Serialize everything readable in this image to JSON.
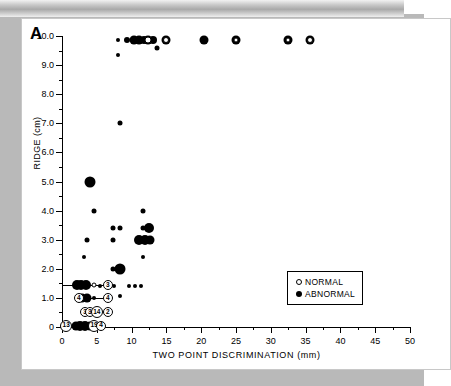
{
  "figure": {
    "panel_label": "A"
  },
  "chart_data": {
    "type": "scatter",
    "title": "",
    "xlabel": "TWO POINT DISCRIMINATION  (mm)",
    "ylabel": "RIDGE (cm)",
    "xlim": [
      0,
      50
    ],
    "ylim": [
      0,
      10
    ],
    "xticks": [
      0,
      5,
      10,
      15,
      20,
      25,
      30,
      35,
      40,
      45,
      50
    ],
    "xticklabels": [
      "0",
      "5",
      "10",
      "15",
      "20",
      "25",
      "30",
      "35",
      "40",
      "45",
      "50"
    ],
    "x_minor_step": 2.5,
    "yticks": [
      0,
      1,
      2,
      3,
      4,
      5,
      6,
      7,
      8,
      9,
      10
    ],
    "yticklabels": [
      "0",
      "1.0",
      "2.0",
      "3.0",
      "4.0",
      "5.0",
      "6.0",
      "7.0",
      "8.0",
      "9.0",
      "10.0"
    ],
    "y_minor_step": 0.5,
    "grid": false,
    "legend_position": "lower right",
    "legend": [
      {
        "label": "NORMAL",
        "marker": "open-circle"
      },
      {
        "label": "ABNORMAL",
        "marker": "filled-circle"
      }
    ],
    "series": [
      {
        "name": "ABNORMAL",
        "marker": "filled-circle",
        "points": [
          {
            "x": 8.0,
            "y": 9.85,
            "size": 4
          },
          {
            "x": 8.0,
            "y": 9.35,
            "size": 4
          },
          {
            "x": 9.4,
            "y": 9.85,
            "size": 6
          },
          {
            "x": 10.3,
            "y": 9.85,
            "size": 9
          },
          {
            "x": 11.0,
            "y": 9.85,
            "size": 9
          },
          {
            "x": 11.8,
            "y": 9.85,
            "size": 8
          },
          {
            "x": 12.4,
            "y": 9.85,
            "size": 9
          },
          {
            "x": 13.1,
            "y": 9.85,
            "size": 8
          },
          {
            "x": 13.6,
            "y": 9.6,
            "size": 5
          },
          {
            "x": 14.9,
            "y": 9.85,
            "size": 9
          },
          {
            "x": 20.4,
            "y": 9.85,
            "size": 9
          },
          {
            "x": 25.0,
            "y": 9.85,
            "size": 9
          },
          {
            "x": 32.5,
            "y": 9.85,
            "size": 9
          },
          {
            "x": 35.6,
            "y": 9.85,
            "size": 9
          },
          {
            "x": 8.3,
            "y": 7.0,
            "size": 5
          },
          {
            "x": 4.0,
            "y": 5.0,
            "size": 11
          },
          {
            "x": 4.6,
            "y": 4.0,
            "size": 5
          },
          {
            "x": 11.7,
            "y": 4.0,
            "size": 5
          },
          {
            "x": 7.3,
            "y": 3.4,
            "size": 5
          },
          {
            "x": 8.3,
            "y": 3.4,
            "size": 5
          },
          {
            "x": 11.6,
            "y": 3.4,
            "size": 5
          },
          {
            "x": 12.5,
            "y": 3.4,
            "size": 10
          },
          {
            "x": 3.6,
            "y": 3.0,
            "size": 5
          },
          {
            "x": 7.3,
            "y": 3.0,
            "size": 5
          },
          {
            "x": 11.0,
            "y": 3.0,
            "size": 10
          },
          {
            "x": 11.9,
            "y": 3.0,
            "size": 10
          },
          {
            "x": 12.6,
            "y": 3.0,
            "size": 9
          },
          {
            "x": 3.1,
            "y": 2.42,
            "size": 4
          },
          {
            "x": 11.7,
            "y": 2.42,
            "size": 4
          },
          {
            "x": 7.3,
            "y": 2.0,
            "size": 5
          },
          {
            "x": 8.3,
            "y": 2.0,
            "size": 11
          },
          {
            "x": 2.1,
            "y": 1.45,
            "size": 10
          },
          {
            "x": 2.8,
            "y": 1.45,
            "size": 10
          },
          {
            "x": 3.5,
            "y": 1.45,
            "size": 10
          },
          {
            "x": 5.4,
            "y": 1.42,
            "size": 4
          },
          {
            "x": 7.5,
            "y": 1.42,
            "size": 4
          },
          {
            "x": 9.6,
            "y": 1.42,
            "size": 4
          },
          {
            "x": 10.5,
            "y": 1.42,
            "size": 4
          },
          {
            "x": 11.4,
            "y": 1.42,
            "size": 4
          },
          {
            "x": 2.9,
            "y": 1.0,
            "size": 9
          },
          {
            "x": 3.6,
            "y": 1.0,
            "size": 9
          },
          {
            "x": 4.6,
            "y": 1.0,
            "size": 4
          },
          {
            "x": 8.3,
            "y": 1.05,
            "size": 4
          },
          {
            "x": 2.0,
            "y": 0.05,
            "size": 9
          },
          {
            "x": 2.6,
            "y": 0.05,
            "size": 10
          },
          {
            "x": 3.3,
            "y": 0.05,
            "size": 10
          },
          {
            "x": 4.0,
            "y": 0.05,
            "size": 9
          }
        ]
      },
      {
        "name": "NORMAL",
        "marker": "open-circle",
        "points": [
          {
            "x": 12.4,
            "y": 9.85,
            "size": 7
          },
          {
            "x": 14.9,
            "y": 9.85,
            "size": 6
          },
          {
            "x": 25.0,
            "y": 9.85,
            "size": 5
          },
          {
            "x": 32.5,
            "y": 9.85,
            "size": 5
          },
          {
            "x": 35.6,
            "y": 9.85,
            "size": 6
          },
          {
            "x": 4.6,
            "y": 1.45,
            "size": 5
          },
          {
            "x": 2.4,
            "y": 1.0,
            "size": 5
          }
        ]
      }
    ],
    "count_labels": [
      {
        "x": 6.6,
        "y": 1.45,
        "count": "3"
      },
      {
        "x": 2.4,
        "y": 1.0,
        "count": "4"
      },
      {
        "x": 6.6,
        "y": 1.0,
        "count": "4"
      },
      {
        "x": 3.3,
        "y": 0.52,
        "count": "3"
      },
      {
        "x": 4.0,
        "y": 0.52,
        "count": "3"
      },
      {
        "x": 5.0,
        "y": 0.52,
        "count": "14"
      },
      {
        "x": 6.6,
        "y": 0.52,
        "count": "2"
      },
      {
        "x": 0.6,
        "y": 0.05,
        "count": "13"
      },
      {
        "x": 4.6,
        "y": 0.05,
        "count": "19"
      },
      {
        "x": 5.6,
        "y": 0.05,
        "count": "4"
      }
    ]
  }
}
